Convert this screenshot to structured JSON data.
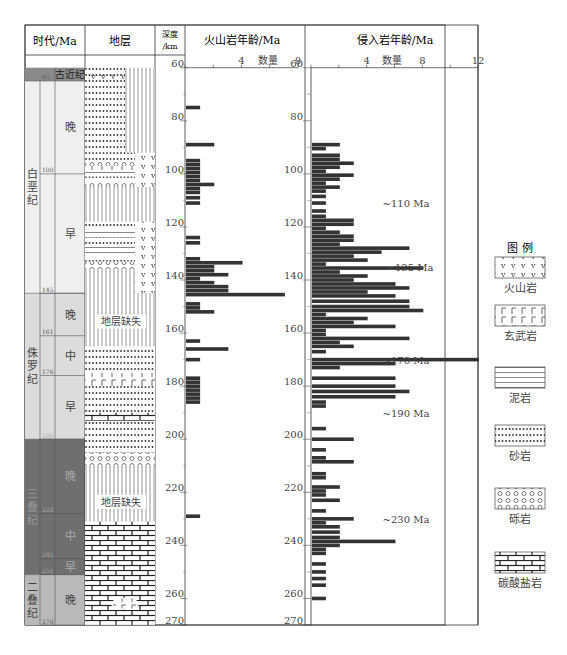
{
  "header": {
    "age_col": "时代/Ma",
    "strata_col": "地层",
    "depth_col_line1": "深度",
    "depth_col_line2": "/km",
    "volcanic_title": "火山岩年龄/Ma",
    "intrusive_title": "侵入岩年龄/Ma",
    "count_label": "数量"
  },
  "depth_ticks": [
    60,
    80,
    100,
    120,
    140,
    160,
    180,
    200,
    220,
    240,
    260,
    270
  ],
  "eras": [
    {
      "label": "古近纪",
      "top": 60,
      "bottom": 65,
      "fill": "#8a8a8a"
    },
    {
      "label": "白垩纪",
      "top": 65,
      "bottom": 145,
      "fill": "#efefef"
    },
    {
      "label": "侏罗纪",
      "top": 145,
      "bottom": 200,
      "fill": "#dcdcdc"
    },
    {
      "label": "三叠纪",
      "top": 200,
      "bottom": 251,
      "fill": "#6f6f6f"
    },
    {
      "label": "二叠纪",
      "top": 251,
      "bottom": 270,
      "fill": "#b9b9b9"
    }
  ],
  "age_boundaries": [
    "65",
    "100",
    "145",
    "161",
    "176",
    "200",
    "228",
    "245",
    "251",
    "270"
  ],
  "stages": [
    {
      "label": "晚",
      "top": 65,
      "bottom": 100
    },
    {
      "label": "早",
      "top": 100,
      "bottom": 145
    },
    {
      "label": "晚",
      "top": 145,
      "bottom": 161
    },
    {
      "label": "中",
      "top": 161,
      "bottom": 176
    },
    {
      "label": "早",
      "top": 176,
      "bottom": 200
    },
    {
      "label": "晚",
      "top": 200,
      "bottom": 228
    },
    {
      "label": "中",
      "top": 228,
      "bottom": 245
    },
    {
      "label": "早",
      "top": 245,
      "bottom": 251
    },
    {
      "label": "晚",
      "top": 251,
      "bottom": 270
    }
  ],
  "strata_gap_label": "地层缺失",
  "annotations": [
    "~110 Ma",
    "~135 Ma",
    "~170 Ma",
    "~190 Ma",
    "~230 Ma"
  ],
  "legend": {
    "title": "图  例",
    "items": [
      {
        "label": "火山岩",
        "pattern": "volcanic"
      },
      {
        "label": "玄武岩",
        "pattern": "basalt"
      },
      {
        "label": "泥岩",
        "pattern": "mudstone"
      },
      {
        "label": "砂岩",
        "pattern": "sandstone"
      },
      {
        "label": "砾岩",
        "pattern": "conglomerate"
      },
      {
        "label": "碳酸盐岩",
        "pattern": "carbonate"
      }
    ]
  },
  "chart_data": [
    {
      "type": "bar",
      "orientation": "horizontal",
      "title": "火山岩年龄/Ma",
      "xlabel": "数量",
      "ylabel": "深度/km (age Ma)",
      "xlim": [
        0,
        8
      ],
      "x_ticks": [
        4,
        8
      ],
      "ylim": [
        60,
        270
      ],
      "y_ticks": [
        60,
        80,
        100,
        120,
        140,
        160,
        180,
        200,
        220,
        240,
        260,
        270
      ],
      "bar_color": "#333333",
      "ages": [
        75,
        89,
        95,
        96.5,
        98,
        99.5,
        101,
        102.5,
        104,
        105.5,
        107,
        109,
        111,
        124,
        126,
        132,
        133.5,
        135,
        136.5,
        138,
        139.5,
        141,
        142.5,
        144,
        145.5,
        149,
        150.5,
        152,
        163,
        166,
        170,
        177,
        178.5,
        180,
        181.5,
        183,
        184.5,
        186,
        229
      ],
      "values": [
        1,
        2,
        1,
        1,
        1,
        1,
        1,
        1,
        2,
        1,
        1,
        1,
        1,
        1,
        1,
        1,
        4,
        2,
        2,
        3,
        1,
        2,
        3,
        3,
        7,
        1,
        1,
        2,
        1,
        3,
        1,
        1,
        1,
        1,
        1,
        1,
        1,
        1,
        1
      ]
    },
    {
      "type": "bar",
      "orientation": "horizontal",
      "title": "侵入岩年龄/Ma",
      "xlabel": "数量",
      "ylabel": "深度/km (age Ma)",
      "xlim": [
        0,
        12
      ],
      "x_ticks": [
        4,
        8,
        12
      ],
      "ylim": [
        60,
        270
      ],
      "y_ticks": [
        60,
        80,
        100,
        120,
        140,
        160,
        180,
        200,
        220,
        240,
        260,
        270
      ],
      "bar_color": "#333333",
      "annotations": [
        "~110 Ma",
        "~135 Ma",
        "~170 Ma",
        "~190 Ma",
        "~230 Ma"
      ],
      "ages": [
        89,
        90.5,
        93,
        94.5,
        96,
        97.5,
        99,
        100.5,
        102,
        103.5,
        105,
        106.5,
        108.5,
        111,
        114,
        116,
        117.5,
        119,
        120.5,
        122,
        123.5,
        125,
        126.5,
        128,
        129.5,
        131,
        132.5,
        134,
        135.5,
        137,
        138.5,
        140,
        141.5,
        143,
        144.5,
        146,
        148,
        150,
        151.5,
        153,
        154.5,
        156,
        157.5,
        159,
        160.5,
        162,
        163.5,
        165,
        167,
        170,
        171.5,
        173,
        177,
        180,
        182,
        184,
        186,
        187.5,
        196,
        200,
        204,
        207,
        208.5,
        213,
        214.5,
        218,
        219.5,
        221,
        223,
        227,
        230,
        231.5,
        233,
        235,
        237,
        238.5,
        240,
        241.5,
        243,
        247,
        250,
        252.5,
        255,
        260
      ],
      "values": [
        2,
        1,
        2,
        2,
        3,
        2,
        1,
        3,
        2,
        1,
        2,
        1,
        1,
        1,
        1,
        1,
        3,
        3,
        1,
        2,
        3,
        3,
        2,
        7,
        5,
        3,
        4,
        1,
        8,
        2,
        4,
        3,
        6,
        7,
        4,
        6,
        7,
        7,
        8,
        1,
        4,
        3,
        6,
        1,
        1,
        7,
        2,
        3,
        1,
        12,
        6,
        2,
        6,
        6,
        7,
        6,
        1,
        1,
        1,
        3,
        1,
        1,
        3,
        1,
        1,
        2,
        1,
        1,
        2,
        1,
        3,
        1,
        2,
        2,
        2,
        6,
        2,
        1,
        1,
        1,
        1,
        1,
        1,
        1
      ]
    }
  ]
}
